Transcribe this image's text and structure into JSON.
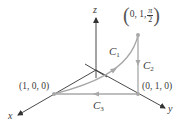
{
  "diagram": {
    "axes": {
      "x_label": "x",
      "y_label": "y",
      "z_label": "z"
    },
    "points": [
      {
        "id": "p100",
        "label": "(1, 0, 0)"
      },
      {
        "id": "p010",
        "label": "(0, 1, 0)"
      },
      {
        "id": "p01pi2",
        "label_prefix": "0, 1,",
        "frac_num": "π",
        "frac_den": "2"
      }
    ],
    "curves": [
      {
        "name": "C",
        "sub": "1",
        "description": "curved path from (1,0,0) to (0,1,π/2)"
      },
      {
        "name": "C",
        "sub": "2",
        "description": "vertical segment from (0,1,π/2) down to (0,1,0)"
      },
      {
        "name": "C",
        "sub": "3",
        "description": "straight segment from (0,1,0) to (1,0,0)"
      }
    ],
    "colors": {
      "axis": "#333333",
      "curve": "#a8a8a8",
      "point": "#a8a8a8",
      "text": "#3a3a3a"
    }
  }
}
